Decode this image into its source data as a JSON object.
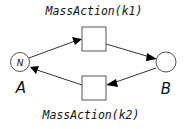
{
  "diagram": {
    "type": "petri-net",
    "places": [
      {
        "id": "A",
        "label": "A",
        "token_label": "N"
      },
      {
        "id": "B",
        "label": "B",
        "token_label": ""
      }
    ],
    "transitions": [
      {
        "id": "t1",
        "label": "MassAction(k1)"
      },
      {
        "id": "t2",
        "label": "MassAction(k2)"
      }
    ],
    "arcs": [
      {
        "from": "A",
        "to": "t1"
      },
      {
        "from": "t1",
        "to": "B"
      },
      {
        "from": "B",
        "to": "t2"
      },
      {
        "from": "t2",
        "to": "A"
      }
    ],
    "colors": {
      "stroke": "#555555",
      "arrow": "#000000",
      "text": "#111111"
    }
  }
}
